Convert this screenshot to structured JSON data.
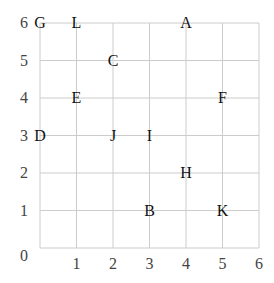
{
  "chart_data": {
    "type": "scatter",
    "title": "",
    "xlabel": "",
    "ylabel": "",
    "xlim": [
      0,
      6
    ],
    "ylim": [
      0,
      6
    ],
    "grid": true,
    "x_ticks": [
      "0",
      "1",
      "2",
      "3",
      "4",
      "5",
      "6"
    ],
    "y_ticks": [
      "0",
      "1",
      "2",
      "3",
      "4",
      "5",
      "6"
    ],
    "points": [
      {
        "label": "G",
        "x": 0,
        "y": 6
      },
      {
        "label": "L",
        "x": 1,
        "y": 6
      },
      {
        "label": "A",
        "x": 4,
        "y": 6
      },
      {
        "label": "C",
        "x": 2,
        "y": 5
      },
      {
        "label": "E",
        "x": 1,
        "y": 4
      },
      {
        "label": "F",
        "x": 5,
        "y": 4
      },
      {
        "label": "D",
        "x": 0,
        "y": 3
      },
      {
        "label": "J",
        "x": 2,
        "y": 3
      },
      {
        "label": "I",
        "x": 3,
        "y": 3
      },
      {
        "label": "H",
        "x": 4,
        "y": 2
      },
      {
        "label": "B",
        "x": 3,
        "y": 1
      },
      {
        "label": "K",
        "x": 5,
        "y": 1
      }
    ]
  },
  "colors": {
    "grid": "#cccccc",
    "text": "#111111",
    "tick": "#444444"
  }
}
